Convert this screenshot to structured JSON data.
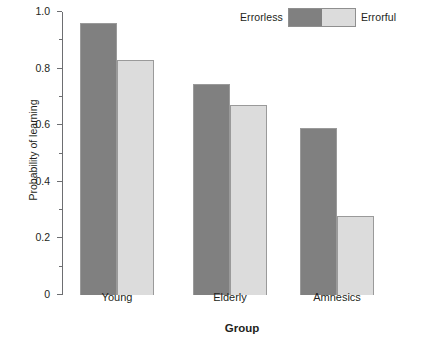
{
  "chart_data": {
    "type": "bar",
    "title": "",
    "xlabel": "Group",
    "ylabel": "Probability of learning",
    "categories": [
      "Young",
      "Elderly",
      "Amnesics"
    ],
    "series": [
      {
        "name": "Errorless",
        "color": "#808080",
        "values": [
          0.96,
          0.745,
          0.59
        ]
      },
      {
        "name": "Errorful",
        "color": "#dcdcdc",
        "values": [
          0.83,
          0.67,
          0.28
        ]
      }
    ],
    "ylim": [
      0,
      1.0
    ],
    "yticks": [
      "0",
      "0.2",
      "0.4",
      "0.6",
      "0.8",
      "1.0"
    ],
    "ytick_values": [
      0,
      0.2,
      0.4,
      0.6,
      0.8,
      1.0
    ],
    "yminor_values": [
      0.1,
      0.3,
      0.5,
      0.7,
      0.9
    ],
    "grid": false,
    "legend_position": "top-right",
    "legend": {
      "left_label": "Errorless",
      "right_label": "Errorful",
      "left_color": "#808080",
      "right_color": "#dcdcdc"
    }
  }
}
